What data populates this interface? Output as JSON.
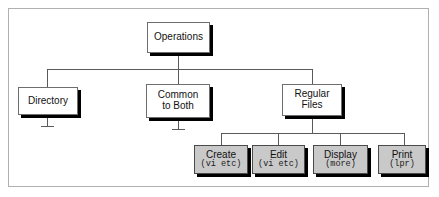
{
  "diagram": {
    "colors": {
      "frame_border": "#b0b0b0",
      "node_border": "#6e6e6e",
      "node_fill": "#ffffff",
      "leaf_fill": "#c9c9c9",
      "shadow": "#000000",
      "connector": "#5a5a5a"
    },
    "root": {
      "label": "Operations"
    },
    "level2": [
      {
        "label": "Directory",
        "line2": ""
      },
      {
        "label": "Common",
        "line2": "to Both"
      },
      {
        "label": "Regular",
        "line2": "Files"
      }
    ],
    "level3": [
      {
        "label": "Create",
        "detail": "(vi etc)"
      },
      {
        "label": "Edit",
        "detail": "(vi etc)"
      },
      {
        "label": "Display",
        "detail": "(more)"
      },
      {
        "label": "Print",
        "detail": "(lpr)"
      }
    ]
  }
}
